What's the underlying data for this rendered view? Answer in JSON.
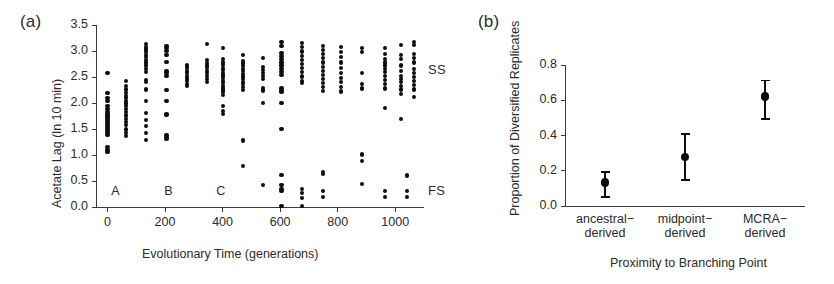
{
  "figure": {
    "background": "#ffffff",
    "ink": "#0d0d0d"
  },
  "panel_a": {
    "label": "(a)",
    "series_labels": {
      "ss": "SS",
      "fs": "FS"
    },
    "phase_markers": [
      {
        "name": "A",
        "x": 30
      },
      {
        "name": "B",
        "x": 215
      },
      {
        "name": "C",
        "x": 395
      }
    ],
    "chart_data": {
      "type": "scatter",
      "title": "",
      "xlabel": "Evolutionary Time (generations)",
      "ylabel": "Acetate Lag (ln 10 min)",
      "xlim": [
        -40,
        1100
      ],
      "ylim": [
        0.0,
        3.5
      ],
      "xticks": [
        0,
        200,
        400,
        600,
        800,
        1000
      ],
      "xtick_labels": [
        "0",
        "200",
        "400",
        "600",
        "800",
        "1000"
      ],
      "yticks": [
        0.0,
        0.5,
        1.0,
        1.5,
        2.0,
        2.5,
        3.0,
        3.5
      ],
      "ytick_labels": [
        "0.0",
        "0.5",
        "1.0",
        "1.5",
        "2.0",
        "2.5",
        "3.0",
        "3.5"
      ],
      "grid": false,
      "legend": "inline-right",
      "annotations": [
        {
          "text": "SS",
          "x": 1080,
          "y": 2.62
        },
        {
          "text": "FS",
          "x": 1080,
          "y": 0.28
        },
        {
          "text": "A",
          "x": 30,
          "y": 0.27
        },
        {
          "text": "B",
          "x": 215,
          "y": 0.27
        },
        {
          "text": "C",
          "x": 395,
          "y": 0.27
        }
      ],
      "series": [
        {
          "name": "SS",
          "points": [
            [
              0,
              2.57
            ],
            [
              0,
              2.19
            ],
            [
              0,
              2.09
            ],
            [
              0,
              2.04
            ],
            [
              0,
              1.95
            ],
            [
              0,
              1.88
            ],
            [
              0,
              1.82
            ],
            [
              0,
              1.78
            ],
            [
              0,
              1.74
            ],
            [
              0,
              1.7
            ],
            [
              0,
              1.66
            ],
            [
              0,
              1.62
            ],
            [
              0,
              1.58
            ],
            [
              0,
              1.54
            ],
            [
              0,
              1.5
            ],
            [
              0,
              1.46
            ],
            [
              0,
              1.42
            ],
            [
              0,
              1.38
            ],
            [
              0,
              1.16
            ],
            [
              0,
              1.09
            ],
            [
              0,
              1.05
            ],
            [
              65,
              2.42
            ],
            [
              65,
              2.33
            ],
            [
              65,
              2.26
            ],
            [
              65,
              2.2
            ],
            [
              65,
              2.14
            ],
            [
              65,
              2.09
            ],
            [
              65,
              2.04
            ],
            [
              65,
              1.99
            ],
            [
              65,
              1.94
            ],
            [
              65,
              1.88
            ],
            [
              65,
              1.82
            ],
            [
              65,
              1.76
            ],
            [
              65,
              1.7
            ],
            [
              65,
              1.64
            ],
            [
              65,
              1.58
            ],
            [
              65,
              1.49
            ],
            [
              65,
              1.42
            ],
            [
              65,
              1.36
            ],
            [
              135,
              3.13
            ],
            [
              135,
              3.08
            ],
            [
              135,
              3.03
            ],
            [
              135,
              2.98
            ],
            [
              135,
              2.93
            ],
            [
              135,
              2.88
            ],
            [
              135,
              2.83
            ],
            [
              135,
              2.78
            ],
            [
              135,
              2.72
            ],
            [
              135,
              2.66
            ],
            [
              135,
              2.6
            ],
            [
              135,
              2.45
            ],
            [
              135,
              2.4
            ],
            [
              135,
              2.26
            ],
            [
              135,
              2.04
            ],
            [
              135,
              1.8
            ],
            [
              135,
              1.67
            ],
            [
              135,
              1.56
            ],
            [
              135,
              1.42
            ],
            [
              135,
              1.29
            ],
            [
              205,
              3.1
            ],
            [
              205,
              3.05
            ],
            [
              205,
              3.0
            ],
            [
              205,
              2.93
            ],
            [
              205,
              2.79
            ],
            [
              205,
              2.62
            ],
            [
              205,
              2.57
            ],
            [
              205,
              2.52
            ],
            [
              205,
              2.25
            ],
            [
              205,
              2.04
            ],
            [
              205,
              1.78
            ],
            [
              205,
              1.38
            ],
            [
              205,
              1.34
            ],
            [
              205,
              1.3
            ],
            [
              275,
              2.72
            ],
            [
              275,
              2.67
            ],
            [
              275,
              2.62
            ],
            [
              275,
              2.57
            ],
            [
              275,
              2.52
            ],
            [
              275,
              2.47
            ],
            [
              275,
              2.42
            ],
            [
              275,
              2.37
            ],
            [
              275,
              2.33
            ],
            [
              345,
              3.13
            ],
            [
              345,
              2.82
            ],
            [
              345,
              2.77
            ],
            [
              345,
              2.72
            ],
            [
              345,
              2.67
            ],
            [
              345,
              2.62
            ],
            [
              345,
              2.57
            ],
            [
              345,
              2.52
            ],
            [
              345,
              2.46
            ],
            [
              345,
              2.4
            ],
            [
              400,
              3.05
            ],
            [
              400,
              2.84
            ],
            [
              400,
              2.78
            ],
            [
              400,
              2.73
            ],
            [
              400,
              2.68
            ],
            [
              400,
              2.63
            ],
            [
              400,
              2.58
            ],
            [
              400,
              2.53
            ],
            [
              400,
              2.48
            ],
            [
              400,
              2.43
            ],
            [
              400,
              2.38
            ],
            [
              400,
              2.33
            ],
            [
              400,
              2.28
            ],
            [
              400,
              2.22
            ],
            [
              400,
              2.16
            ],
            [
              400,
              1.94
            ],
            [
              400,
              1.84
            ],
            [
              400,
              1.79
            ],
            [
              470,
              2.92
            ],
            [
              470,
              2.81
            ],
            [
              470,
              2.76
            ],
            [
              470,
              2.71
            ],
            [
              470,
              2.66
            ],
            [
              470,
              2.61
            ],
            [
              470,
              2.56
            ],
            [
              470,
              2.51
            ],
            [
              470,
              2.46
            ],
            [
              470,
              2.41
            ],
            [
              470,
              2.36
            ],
            [
              470,
              2.31
            ],
            [
              470,
              2.25
            ],
            [
              540,
              2.86
            ],
            [
              540,
              2.7
            ],
            [
              540,
              2.64
            ],
            [
              540,
              2.58
            ],
            [
              540,
              2.52
            ],
            [
              540,
              2.46
            ],
            [
              540,
              2.29
            ],
            [
              540,
              2.24
            ],
            [
              540,
              2.0
            ],
            [
              605,
              3.18
            ],
            [
              605,
              3.1
            ],
            [
              605,
              2.96
            ],
            [
              605,
              2.9
            ],
            [
              605,
              2.84
            ],
            [
              605,
              2.78
            ],
            [
              605,
              2.72
            ],
            [
              605,
              2.66
            ],
            [
              605,
              2.6
            ],
            [
              605,
              2.54
            ],
            [
              605,
              2.28
            ],
            [
              605,
              2.22
            ],
            [
              605,
              2.0
            ],
            [
              605,
              1.5
            ],
            [
              675,
              3.15
            ],
            [
              675,
              3.07
            ],
            [
              675,
              2.99
            ],
            [
              675,
              2.91
            ],
            [
              675,
              2.83
            ],
            [
              675,
              2.75
            ],
            [
              675,
              2.67
            ],
            [
              675,
              2.59
            ],
            [
              675,
              2.51
            ],
            [
              675,
              2.43
            ],
            [
              675,
              2.38
            ],
            [
              750,
              3.1
            ],
            [
              750,
              3.02
            ],
            [
              750,
              2.94
            ],
            [
              750,
              2.86
            ],
            [
              750,
              2.78
            ],
            [
              750,
              2.7
            ],
            [
              750,
              2.62
            ],
            [
              750,
              2.54
            ],
            [
              750,
              2.46
            ],
            [
              750,
              2.38
            ],
            [
              750,
              2.3
            ],
            [
              750,
              2.23
            ],
            [
              812,
              3.08
            ],
            [
              812,
              2.98
            ],
            [
              812,
              2.88
            ],
            [
              812,
              2.78
            ],
            [
              812,
              2.68
            ],
            [
              812,
              2.58
            ],
            [
              812,
              2.48
            ],
            [
              812,
              2.4
            ],
            [
              812,
              2.3
            ],
            [
              812,
              2.22
            ],
            [
              885,
              3.06
            ],
            [
              885,
              2.98
            ],
            [
              885,
              2.58
            ],
            [
              885,
              2.36
            ],
            [
              885,
              2.28
            ],
            [
              965,
              3.05
            ],
            [
              965,
              2.95
            ],
            [
              965,
              2.85
            ],
            [
              965,
              2.78
            ],
            [
              965,
              2.72
            ],
            [
              965,
              2.66
            ],
            [
              965,
              2.6
            ],
            [
              965,
              2.52
            ],
            [
              965,
              2.44
            ],
            [
              965,
              2.36
            ],
            [
              965,
              2.28
            ],
            [
              965,
              1.9
            ],
            [
              1020,
              3.12
            ],
            [
              1020,
              2.92
            ],
            [
              1020,
              2.84
            ],
            [
              1020,
              2.72
            ],
            [
              1020,
              2.62
            ],
            [
              1020,
              2.52
            ],
            [
              1020,
              2.46
            ],
            [
              1020,
              2.4
            ],
            [
              1020,
              2.33
            ],
            [
              1020,
              2.26
            ],
            [
              1020,
              2.18
            ],
            [
              1020,
              1.7
            ],
            [
              1065,
              3.18
            ],
            [
              1065,
              3.12
            ],
            [
              1065,
              2.94
            ],
            [
              1065,
              2.86
            ],
            [
              1065,
              2.78
            ],
            [
              1065,
              2.66
            ],
            [
              1065,
              2.58
            ],
            [
              1065,
              2.5
            ],
            [
              1065,
              2.42
            ],
            [
              1065,
              2.34
            ],
            [
              1065,
              2.26
            ],
            [
              1065,
              2.12
            ]
          ]
        },
        {
          "name": "FS",
          "points": [
            [
              470,
              1.28
            ],
            [
              470,
              0.79
            ],
            [
              540,
              0.43
            ],
            [
              605,
              0.62
            ],
            [
              605,
              0.42
            ],
            [
              605,
              0.35
            ],
            [
              605,
              0.3
            ],
            [
              605,
              0.02
            ],
            [
              675,
              0.35
            ],
            [
              675,
              0.27
            ],
            [
              675,
              0.17
            ],
            [
              675,
              0.02
            ],
            [
              750,
              0.68
            ],
            [
              750,
              0.64
            ],
            [
              750,
              0.31
            ],
            [
              750,
              0.19
            ],
            [
              885,
              1.01
            ],
            [
              885,
              0.88
            ],
            [
              885,
              0.44
            ],
            [
              965,
              0.31
            ],
            [
              965,
              0.19
            ],
            [
              1040,
              0.62
            ],
            [
              1040,
              0.6
            ],
            [
              1040,
              0.3
            ],
            [
              1040,
              0.19
            ]
          ]
        }
      ]
    }
  },
  "panel_b": {
    "label": "(b)",
    "chart_data": {
      "type": "scatter",
      "title": "",
      "xlabel": "Proximity to Branching Point",
      "ylabel": "Proportion of Diversified Replicates",
      "categories": [
        "ancestral−\nderived",
        "midpoint−\nderived",
        "MCRA−\nderived"
      ],
      "values": [
        0.135,
        0.277,
        0.622
      ],
      "err_low": [
        0.09,
        0.135,
        0.135
      ],
      "err_high": [
        0.065,
        0.135,
        0.095
      ],
      "ylim": [
        0.0,
        0.8
      ],
      "yticks": [
        0.0,
        0.2,
        0.4,
        0.6,
        0.8
      ],
      "ytick_labels": [
        "0.0",
        "0.2",
        "0.4",
        "0.6",
        "0.8"
      ],
      "grid": false,
      "legend": "none",
      "errorbar_style": "mean-with-ci"
    }
  }
}
